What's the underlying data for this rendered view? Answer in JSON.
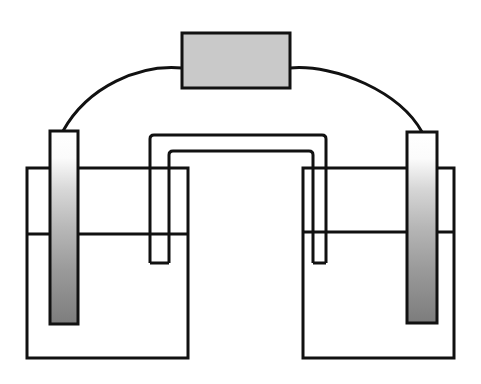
{
  "figure": {
    "type": "galvanic-cell-schematic",
    "background_color": "#ffffff",
    "stroke_color": "#111111",
    "canvas": {
      "width": 481,
      "height": 384
    }
  },
  "meter": {
    "name": "meter-box",
    "label": "",
    "fill_color": "#c9c9c9",
    "stroke_color": "#111111",
    "x": 182,
    "y": 33,
    "width": 108,
    "height": 55,
    "stroke_width": 3
  },
  "wires": {
    "stroke_color": "#111111",
    "stroke_width": 3,
    "left": {
      "name": "left-wire",
      "path": "M 182 68 C 140 64 88 86 63 131"
    },
    "right": {
      "name": "right-wire",
      "path": "M 290 68 C 336 64 400 92 422 132"
    }
  },
  "beakers": {
    "stroke_color": "#111111",
    "stroke_width": 3,
    "fill_color": "#ffffff",
    "left": {
      "name": "left-beaker",
      "x": 27,
      "y": 168,
      "width": 161,
      "height": 190,
      "solution_level_y": 234
    },
    "right": {
      "name": "right-beaker",
      "x": 303,
      "y": 168,
      "width": 151,
      "height": 190,
      "solution_level_y": 232
    }
  },
  "electrodes": {
    "stroke_color": "#111111",
    "stroke_width": 3,
    "gradient_top_color": "#ffffff",
    "gradient_mid_color": "#b4b4b4",
    "gradient_bottom_color": "#7d7d7d",
    "left": {
      "name": "left-electrode",
      "label": "",
      "x": 50,
      "y": 131,
      "width": 28,
      "height": 193
    },
    "right": {
      "name": "right-electrode",
      "label": "",
      "x": 407,
      "y": 132,
      "width": 30,
      "height": 191
    }
  },
  "salt_bridge": {
    "name": "salt-bridge",
    "label": "",
    "stroke_color": "#111111",
    "stroke_width": 3,
    "outer_left_x": 150,
    "outer_right_x": 326,
    "inner_left_x": 169,
    "inner_right_x": 313,
    "outer_top_y": 135,
    "inner_top_y": 151,
    "left_tube_bottom_y": 263,
    "right_tube_bottom_y": 263,
    "corner_radius": 4
  }
}
